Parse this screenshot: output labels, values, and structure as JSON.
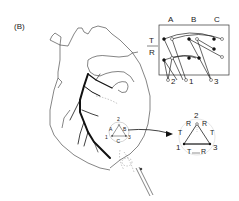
{
  "figure": {
    "panel_label": "(B)",
    "stroke_color": "#222222",
    "vessel_color": "#111111"
  },
  "lead_box": {
    "column_labels": [
      "A",
      "B",
      "C"
    ],
    "row_labels": [
      "T",
      "R"
    ],
    "output_labels": [
      "2",
      "1",
      "3"
    ]
  },
  "heart_inset": {
    "electrode_labels": [
      "A",
      "B",
      "C"
    ],
    "point_labels": [
      "1",
      "2",
      "3"
    ]
  },
  "triangle": {
    "vertex_labels": [
      "2",
      "1",
      "3"
    ],
    "edge_labels": {
      "left_top": "R",
      "right_top": "R",
      "left_side": "T",
      "right_side": "T",
      "bottom_left": "T",
      "bottom_right": "R"
    }
  }
}
